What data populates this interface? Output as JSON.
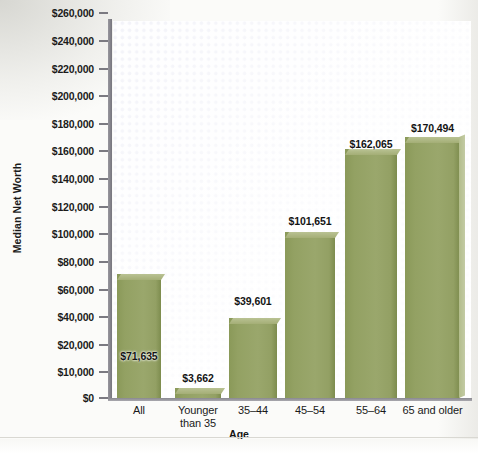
{
  "chart_data": {
    "type": "bar",
    "title": "",
    "xlabel": "Age",
    "ylabel": "Median Net Worth",
    "categories": [
      "All",
      "Younger than 35",
      "35–44",
      "45–54",
      "55–64",
      "65 and older"
    ],
    "values": [
      71635,
      3662,
      39601,
      101651,
      162065,
      170494
    ],
    "value_labels": [
      "$71,635",
      "$3,662",
      "$39,601",
      "$101,651",
      "$162,065",
      "$170,494"
    ],
    "ylim": [
      0,
      260000
    ],
    "yticks": [
      0,
      10000,
      20000,
      40000,
      60000,
      80000,
      100000,
      120000,
      140000,
      160000,
      180000,
      200000,
      220000,
      240000,
      260000
    ],
    "ytick_labels": [
      "$0",
      "$10,000",
      "$20,000",
      "$40,000",
      "$60,000",
      "$80,000",
      "$100,000",
      "$120,000",
      "$140,000",
      "$160,000",
      "$180,000",
      "$200,000",
      "$220,000",
      "$240,000",
      "$260,000"
    ],
    "grid": false,
    "legend": "none",
    "bar_color": "#93a163",
    "bar_top_color": "#b0ba88",
    "axis_color": "#7b7a81",
    "plot_background": "#fdfdfe",
    "dot_pattern_color": "#c6c8e2"
  },
  "xtick_lines": [
    [
      "All"
    ],
    [
      "Younger",
      "than 35"
    ],
    [
      "35–44"
    ],
    [
      "45–54"
    ],
    [
      "55–64"
    ],
    [
      "65 and older"
    ]
  ]
}
